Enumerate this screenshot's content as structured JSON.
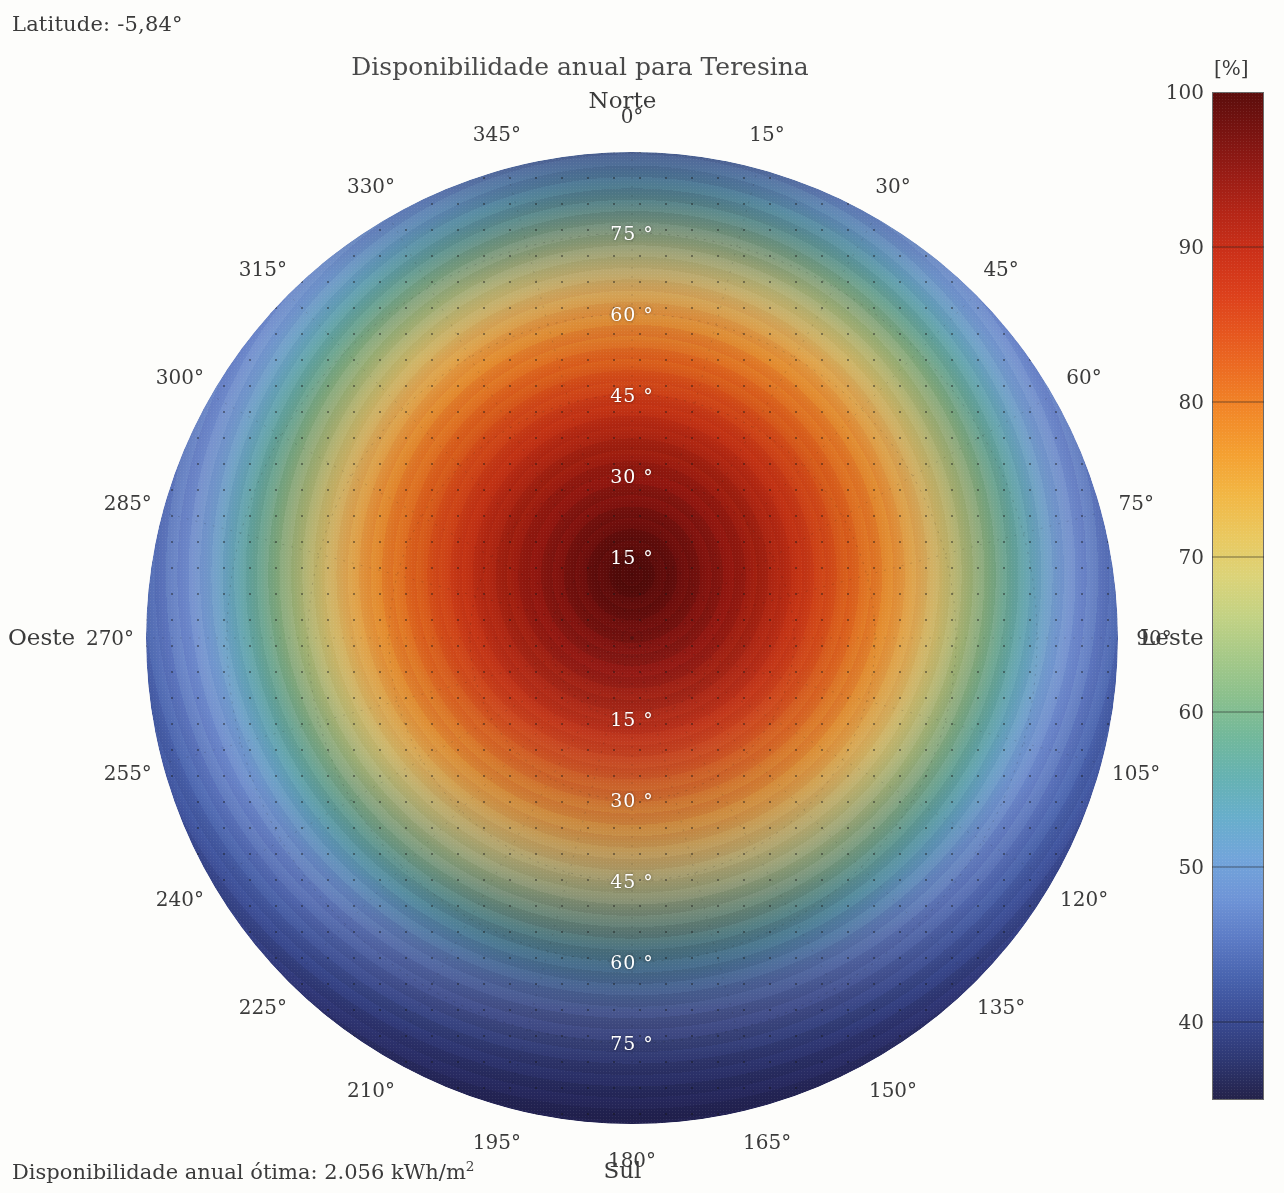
{
  "annotations": {
    "latitude": "Latitude: -5,84°",
    "optimal_prefix": "Disponibilidade anual ótima: 2.056 kWh/m",
    "optimal_exponent": "2"
  },
  "title": "Disponibilidade anual para Teresina",
  "cardinals": {
    "north": "Norte",
    "south": "Sul",
    "west": "Oeste",
    "east": "Leste"
  },
  "colorbar": {
    "unit": "[%]",
    "ticks": [
      "100",
      "90",
      "80",
      "70",
      "60",
      "50",
      "40"
    ],
    "min": 35,
    "max": 100
  },
  "chart_data": {
    "type": "heatmap",
    "subtype": "polar-contour",
    "title": "Disponibilidade anual para Teresina",
    "unit": "%",
    "location": "Teresina",
    "latitude_deg": -5.84,
    "optimal_annual_availability_kwh_m2": 2056,
    "radial_axis": {
      "label": "Inclinação",
      "unit": "°",
      "ticks": [
        15,
        30,
        45,
        60,
        75
      ],
      "tick_labels": [
        "15 °",
        "30 °",
        "45 °",
        "60 °",
        "75 °"
      ],
      "range": [
        0,
        90
      ]
    },
    "angular_axis": {
      "label": "Azimute",
      "unit": "°",
      "zero_at": "north",
      "direction": "clockwise",
      "ticks": [
        0,
        15,
        30,
        45,
        60,
        75,
        90,
        105,
        120,
        135,
        150,
        165,
        180,
        195,
        210,
        225,
        240,
        255,
        270,
        285,
        300,
        315,
        330,
        345
      ],
      "tick_labels": [
        "0°",
        "15°",
        "30°",
        "45°",
        "60°",
        "75°",
        "90°",
        "105°",
        "120°",
        "135°",
        "150°",
        "165°",
        "180°",
        "195°",
        "210°",
        "225°",
        "240°",
        "255°",
        "270°",
        "285°",
        "300°",
        "315°",
        "330°",
        "345°"
      ]
    },
    "colormap": "jet-like (dark red = 100%, dark navy = 35%)",
    "zrange": [
      35,
      100
    ],
    "grid": true,
    "legend_position": "right",
    "peak": {
      "azimuth_deg": 0,
      "tilt_deg": 6,
      "value": 100
    },
    "series": [
      {
        "azimuth_deg": 0,
        "values_by_tilt": {
          "0": 99,
          "15": 98,
          "30": 93,
          "45": 84,
          "60": 73,
          "75": 58,
          "90": 43
        }
      },
      {
        "azimuth_deg": 15,
        "values_by_tilt": {
          "0": 99,
          "15": 98,
          "30": 93,
          "45": 84,
          "60": 72,
          "75": 57,
          "90": 42
        }
      },
      {
        "azimuth_deg": 30,
        "values_by_tilt": {
          "0": 99,
          "15": 97,
          "30": 92,
          "45": 82,
          "60": 70,
          "75": 55,
          "90": 41
        }
      },
      {
        "azimuth_deg": 45,
        "values_by_tilt": {
          "0": 99,
          "15": 96,
          "30": 90,
          "45": 80,
          "60": 67,
          "75": 52,
          "90": 40
        }
      },
      {
        "azimuth_deg": 60,
        "values_by_tilt": {
          "0": 99,
          "15": 95,
          "30": 88,
          "45": 77,
          "60": 64,
          "75": 50,
          "90": 39
        }
      },
      {
        "azimuth_deg": 75,
        "values_by_tilt": {
          "0": 99,
          "15": 94,
          "30": 86,
          "45": 74,
          "60": 61,
          "75": 47,
          "90": 38
        }
      },
      {
        "azimuth_deg": 90,
        "values_by_tilt": {
          "0": 99,
          "15": 93,
          "30": 84,
          "45": 71,
          "60": 58,
          "75": 44,
          "90": 37
        }
      },
      {
        "azimuth_deg": 105,
        "values_by_tilt": {
          "0": 99,
          "15": 92,
          "30": 82,
          "45": 68,
          "60": 54,
          "75": 41,
          "90": 36
        }
      },
      {
        "azimuth_deg": 120,
        "values_by_tilt": {
          "0": 99,
          "15": 91,
          "30": 79,
          "45": 65,
          "60": 50,
          "75": 39,
          "90": 36
        }
      },
      {
        "azimuth_deg": 135,
        "values_by_tilt": {
          "0": 99,
          "15": 90,
          "30": 77,
          "45": 61,
          "60": 47,
          "75": 37,
          "90": 35
        }
      },
      {
        "azimuth_deg": 150,
        "values_by_tilt": {
          "0": 99,
          "15": 89,
          "30": 75,
          "45": 58,
          "60": 44,
          "75": 36,
          "90": 35
        }
      },
      {
        "azimuth_deg": 165,
        "values_by_tilt": {
          "0": 99,
          "15": 88,
          "30": 74,
          "45": 57,
          "60": 42,
          "75": 35,
          "90": 35
        }
      },
      {
        "azimuth_deg": 180,
        "values_by_tilt": {
          "0": 99,
          "15": 88,
          "30": 73,
          "45": 56,
          "60": 41,
          "75": 35,
          "90": 35
        }
      },
      {
        "azimuth_deg": 195,
        "values_by_tilt": {
          "0": 99,
          "15": 88,
          "30": 74,
          "45": 57,
          "60": 42,
          "75": 35,
          "90": 35
        }
      },
      {
        "azimuth_deg": 210,
        "values_by_tilt": {
          "0": 99,
          "15": 89,
          "30": 75,
          "45": 58,
          "60": 44,
          "75": 36,
          "90": 35
        }
      },
      {
        "azimuth_deg": 225,
        "values_by_tilt": {
          "0": 99,
          "15": 90,
          "30": 77,
          "45": 61,
          "60": 47,
          "75": 37,
          "90": 35
        }
      },
      {
        "azimuth_deg": 240,
        "values_by_tilt": {
          "0": 99,
          "15": 91,
          "30": 79,
          "45": 65,
          "60": 50,
          "75": 39,
          "90": 36
        }
      },
      {
        "azimuth_deg": 255,
        "values_by_tilt": {
          "0": 99,
          "15": 92,
          "30": 82,
          "45": 68,
          "60": 54,
          "75": 41,
          "90": 36
        }
      },
      {
        "azimuth_deg": 270,
        "values_by_tilt": {
          "0": 99,
          "15": 93,
          "30": 84,
          "45": 71,
          "60": 58,
          "75": 44,
          "90": 37
        }
      },
      {
        "azimuth_deg": 285,
        "values_by_tilt": {
          "0": 99,
          "15": 94,
          "30": 86,
          "45": 74,
          "60": 61,
          "75": 47,
          "90": 38
        }
      },
      {
        "azimuth_deg": 300,
        "values_by_tilt": {
          "0": 99,
          "15": 95,
          "30": 88,
          "45": 77,
          "60": 64,
          "75": 50,
          "90": 39
        }
      },
      {
        "azimuth_deg": 315,
        "values_by_tilt": {
          "0": 99,
          "15": 96,
          "30": 90,
          "45": 80,
          "60": 67,
          "75": 52,
          "90": 40
        }
      },
      {
        "azimuth_deg": 330,
        "values_by_tilt": {
          "0": 99,
          "15": 97,
          "30": 92,
          "45": 82,
          "60": 70,
          "75": 55,
          "90": 41
        }
      },
      {
        "azimuth_deg": 345,
        "values_by_tilt": {
          "0": 99,
          "15": 98,
          "30": 93,
          "45": 84,
          "60": 72,
          "75": 57,
          "90": 42
        }
      }
    ]
  }
}
